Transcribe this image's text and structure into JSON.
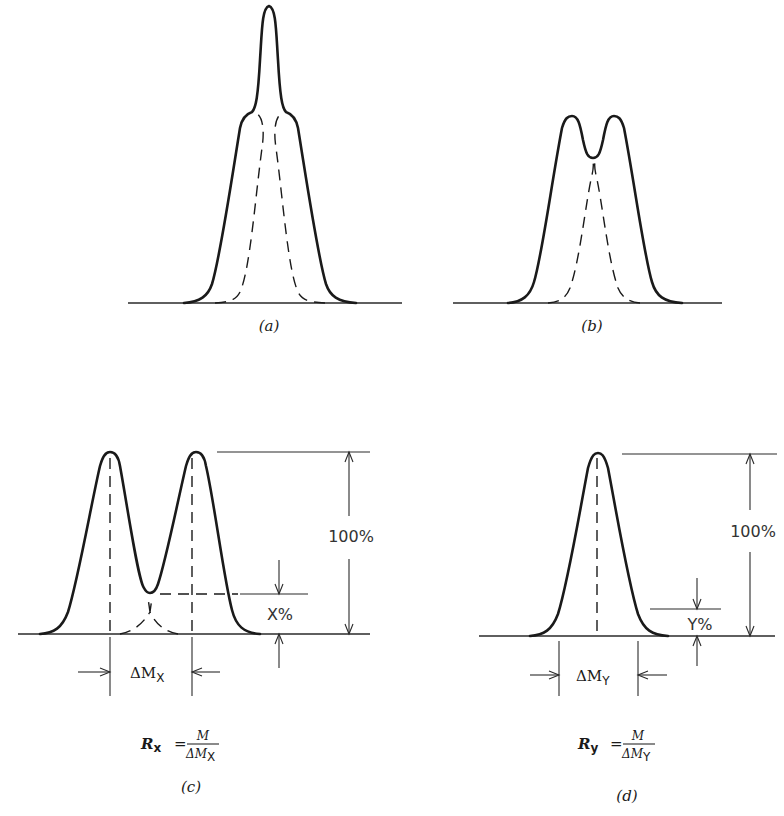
{
  "figure": {
    "panels": [
      {
        "id": "a",
        "caption": "(a)",
        "description": "Two overlapping peaks unresolved; sum shows single tall central peak with shoulders"
      },
      {
        "id": "b",
        "caption": "(b)",
        "description": "Two overlapping peaks partially resolved; sum shows two maxima with shallow valley"
      },
      {
        "id": "c",
        "caption": "(c)",
        "full_height_label": "100%",
        "valley_label": "X%",
        "width_label_main": "ΔM",
        "width_label_sub": "X",
        "formula": {
          "lhs": "R",
          "lhs_sub": "x",
          "equals": "=",
          "numerator": "M",
          "denominator_main": "ΔM",
          "denominator_sub": "X"
        }
      },
      {
        "id": "d",
        "caption": "(d)",
        "full_height_label": "100%",
        "level_label": "Y%",
        "width_label_main": "ΔM",
        "width_label_sub": "Y",
        "formula": {
          "lhs": "R",
          "lhs_sub": "y",
          "equals": "=",
          "numerator": "M",
          "denominator_main": "ΔM",
          "denominator_sub": "Y"
        }
      }
    ],
    "colors": {
      "ink": "#1a1a1a",
      "background": "#ffffff"
    }
  }
}
